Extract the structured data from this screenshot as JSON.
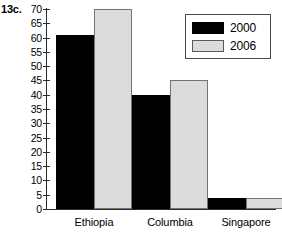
{
  "figure": {
    "label": "13c."
  },
  "chart_data": {
    "type": "bar",
    "title": "",
    "xlabel": "",
    "ylabel": "",
    "categories": [
      "Ethiopia",
      "Columbia",
      "Singapore"
    ],
    "series": [
      {
        "name": "2000",
        "color": "#000000",
        "values": [
          61,
          40,
          4
        ]
      },
      {
        "name": "2006",
        "color": "#dcdcdc",
        "values": [
          70,
          45,
          4
        ]
      }
    ],
    "ylim": [
      0,
      70
    ],
    "ytick_step": 5,
    "yticks": [
      70,
      65,
      60,
      55,
      50,
      45,
      40,
      35,
      30,
      25,
      20,
      15,
      10,
      5,
      0
    ],
    "ytick_labels": [
      "70",
      "65",
      "60",
      "55",
      "50",
      "45",
      "40",
      "35",
      "30",
      "25",
      "20",
      "15",
      "10",
      "5",
      "0"
    ],
    "grid": false,
    "legend_position": "upper-right",
    "legend_entries": [
      "2000",
      "2006"
    ]
  }
}
